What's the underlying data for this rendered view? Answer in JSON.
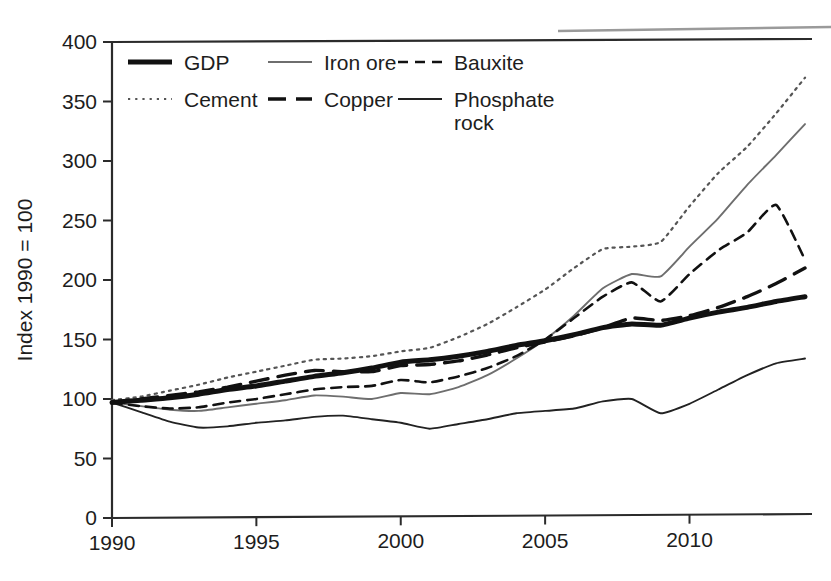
{
  "figure": {
    "background": "#ffffff",
    "ink": "#1d1d1d",
    "top_rule_color": "#9a9a9a"
  },
  "axes": {
    "y_axis_title": "Index 1990 = 100",
    "y_ticks": [
      "0",
      "50",
      "100",
      "150",
      "200",
      "250",
      "300",
      "350",
      "400"
    ],
    "x_ticks": [
      "1990",
      "1995",
      "2000",
      "2005",
      "2010"
    ]
  },
  "legend": {
    "row1": [
      {
        "label": "GDP",
        "style": "thick-solid",
        "color": "#111111"
      },
      {
        "label": "Iron ore",
        "style": "thin-solid-gray",
        "color": "#6e6e6e"
      },
      {
        "label": "Bauxite",
        "style": "short-dash",
        "color": "#111111"
      }
    ],
    "row2": [
      {
        "label": "Cement",
        "style": "dotted",
        "color": "#555555"
      },
      {
        "label": "Copper",
        "style": "long-dash",
        "color": "#111111"
      },
      {
        "label": "Phosphate rock",
        "style": "thin-solid",
        "color": "#222222"
      }
    ]
  },
  "chart_data": {
    "type": "line",
    "title": "",
    "subtitle": "",
    "xlabel": "",
    "ylabel": "Index 1990 = 100",
    "xlim": [
      1990,
      2014
    ],
    "ylim": [
      0,
      400
    ],
    "yticks": [
      0,
      50,
      100,
      150,
      200,
      250,
      300,
      350,
      400
    ],
    "xticks": [
      1990,
      1995,
      2000,
      2005,
      2010
    ],
    "grid": false,
    "legend_position": "top-inside",
    "x": [
      1990,
      1991,
      1992,
      1993,
      1994,
      1995,
      1996,
      1997,
      1998,
      1999,
      2000,
      2001,
      2002,
      2003,
      2004,
      2005,
      2006,
      2007,
      2008,
      2009,
      2010,
      2011,
      2012,
      2013,
      2014
    ],
    "series": [
      {
        "name": "GDP",
        "style": "thick-solid",
        "color": "#111111",
        "values": [
          97,
          99,
          101,
          104,
          108,
          111,
          115,
          119,
          122,
          126,
          131,
          133,
          136,
          140,
          145,
          149,
          154,
          160,
          163,
          162,
          168,
          173,
          177,
          182,
          186
        ]
      },
      {
        "name": "Iron ore",
        "style": "thin-solid-gray",
        "color": "#6e6e6e",
        "values": [
          97,
          94,
          91,
          90,
          93,
          96,
          99,
          103,
          102,
          100,
          105,
          104,
          110,
          120,
          134,
          150,
          170,
          193,
          205,
          203,
          228,
          252,
          280,
          305,
          331
        ]
      },
      {
        "name": "Bauxite",
        "style": "short-dash",
        "color": "#111111",
        "values": [
          97,
          94,
          92,
          93,
          97,
          100,
          104,
          108,
          110,
          111,
          116,
          114,
          119,
          126,
          136,
          150,
          168,
          186,
          198,
          182,
          205,
          225,
          240,
          263,
          217
        ]
      },
      {
        "name": "Cement",
        "style": "dotted",
        "color": "#555555",
        "values": [
          99,
          102,
          107,
          112,
          118,
          123,
          128,
          133,
          134,
          136,
          140,
          143,
          152,
          163,
          177,
          192,
          210,
          226,
          228,
          232,
          262,
          290,
          312,
          340,
          370
        ]
      },
      {
        "name": "Copper",
        "style": "long-dash",
        "color": "#111111",
        "values": [
          97,
          100,
          103,
          106,
          110,
          115,
          120,
          124,
          123,
          123,
          128,
          129,
          132,
          137,
          143,
          148,
          153,
          160,
          168,
          166,
          170,
          177,
          186,
          197,
          210
        ]
      },
      {
        "name": "Phosphate rock",
        "style": "thin-solid",
        "color": "#222222",
        "values": [
          97,
          89,
          81,
          76,
          77,
          80,
          82,
          85,
          86,
          83,
          80,
          75,
          79,
          83,
          88,
          90,
          92,
          98,
          100,
          88,
          96,
          108,
          120,
          130,
          134
        ]
      }
    ]
  }
}
